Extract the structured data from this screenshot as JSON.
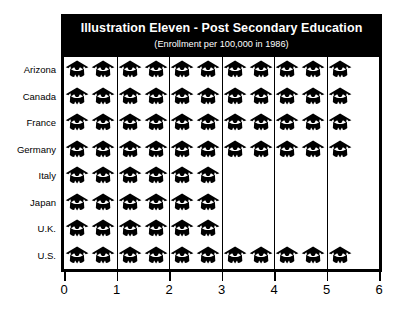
{
  "chart_data": {
    "type": "bar",
    "subtype": "pictograph",
    "title": "Illustration Eleven - Post Secondary Education",
    "subtitle": "(Enrollment per 100,000 in 1986)",
    "xlabel": "",
    "ylabel": "",
    "xlim": [
      0,
      6
    ],
    "xticks": [
      0,
      1,
      2,
      3,
      4,
      5,
      6
    ],
    "xticklabels": [
      "0",
      "1",
      "2",
      "3",
      "4",
      "5",
      "6"
    ],
    "grid": true,
    "gridlines_x": [
      1,
      2,
      3,
      4,
      5
    ],
    "legend": null,
    "icon": "graduation-cap",
    "icon_unit_value": 0.5,
    "categories": [
      "Arizona",
      "Canada",
      "France",
      "Germany",
      "Italy",
      "Japan",
      "U.K.",
      "U.S."
    ],
    "values": [
      5.5,
      5.5,
      5.5,
      5.5,
      3,
      3,
      3,
      5.5
    ],
    "icon_counts": [
      11,
      11,
      11,
      11,
      6,
      6,
      6,
      11
    ],
    "series": [
      {
        "name": "Enrollment per 100,000 in 1986",
        "values": [
          5.5,
          5.5,
          5.5,
          5.5,
          3,
          3,
          3,
          5.5
        ]
      }
    ],
    "colors": {
      "icon": "#000000",
      "banner_background": "#000000",
      "banner_text": "#ffffff",
      "axis": "#000000",
      "gridline": "#000000",
      "plot_background": "#ffffff"
    }
  }
}
